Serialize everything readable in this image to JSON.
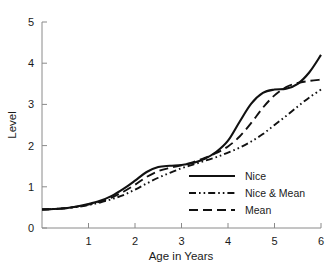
{
  "chart_data": {
    "type": "line",
    "title": "",
    "xlabel": "Age in Years",
    "ylabel": "Level",
    "xlim": [
      0,
      6
    ],
    "ylim": [
      0,
      5
    ],
    "grid": false,
    "legend_position": "inside-lower-right",
    "xticks": [
      1,
      2,
      3,
      4,
      5,
      6
    ],
    "xtick_labels": [
      "1",
      "2",
      "3",
      "4",
      "5",
      "6"
    ],
    "yticks": [
      0,
      1,
      2,
      3,
      4,
      5
    ],
    "ytick_labels": [
      "0",
      "1",
      "2",
      "3",
      "4",
      "5"
    ],
    "x": [
      0.0,
      0.25,
      0.5,
      0.75,
      1.0,
      1.25,
      1.5,
      1.75,
      2.0,
      2.25,
      2.5,
      2.75,
      3.0,
      3.25,
      3.5,
      3.75,
      4.0,
      4.25,
      4.5,
      4.75,
      5.0,
      5.25,
      5.5,
      5.75,
      6.0
    ],
    "series": [
      {
        "name": "Nice",
        "style": "solid",
        "color": "#111111",
        "values": [
          0.45,
          0.46,
          0.48,
          0.52,
          0.58,
          0.66,
          0.78,
          0.95,
          1.15,
          1.36,
          1.48,
          1.51,
          1.53,
          1.58,
          1.68,
          1.85,
          2.12,
          2.58,
          3.02,
          3.28,
          3.36,
          3.38,
          3.5,
          3.78,
          4.2
        ]
      },
      {
        "name": "Nice & Mean",
        "style": "dash-dot-dot",
        "color": "#111111",
        "values": [
          0.45,
          0.46,
          0.48,
          0.51,
          0.56,
          0.62,
          0.7,
          0.8,
          0.93,
          1.08,
          1.22,
          1.34,
          1.45,
          1.54,
          1.63,
          1.72,
          1.83,
          1.95,
          2.1,
          2.28,
          2.5,
          2.72,
          2.95,
          3.17,
          3.36
        ]
      },
      {
        "name": "Mean",
        "style": "dashed",
        "color": "#111111",
        "values": [
          0.45,
          0.46,
          0.48,
          0.52,
          0.57,
          0.64,
          0.74,
          0.88,
          1.05,
          1.24,
          1.38,
          1.46,
          1.52,
          1.6,
          1.7,
          1.82,
          1.98,
          2.22,
          2.55,
          2.92,
          3.22,
          3.42,
          3.52,
          3.57,
          3.6
        ]
      }
    ]
  },
  "legend": {
    "items": [
      {
        "label": "Nice",
        "style": "solid"
      },
      {
        "label": "Nice & Mean",
        "style": "dash-dot-dot"
      },
      {
        "label": "Mean",
        "style": "dashed"
      }
    ]
  }
}
